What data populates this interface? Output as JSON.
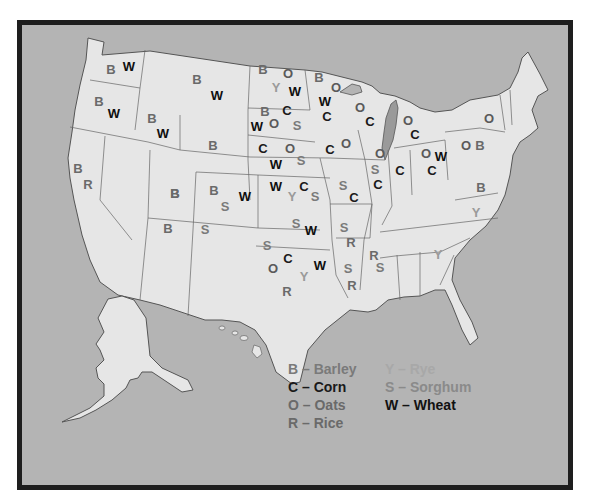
{
  "colors": {
    "ocean": "#b4b4b4",
    "land": "#e6e6e6",
    "border": "#1e1e1e",
    "state_line": "#555555",
    "lake": "#9a9a9a",
    "barley": "#6a6a6a",
    "corn": "#1a1a1a",
    "oats": "#5a5a5a",
    "rice": "#6a6a6a",
    "rye": "#9a9a9a",
    "sorghum": "#7a7a7a",
    "wheat": "#0f0f0f"
  },
  "legend": {
    "items": [
      {
        "code": "B",
        "dash": "–",
        "name": "Barley",
        "color": "#7a7a7a"
      },
      {
        "code": "C",
        "dash": "–",
        "name": "Corn",
        "color": "#1a1a1a"
      },
      {
        "code": "O",
        "dash": "–",
        "name": "Oats",
        "color": "#6a6a6a"
      },
      {
        "code": "R",
        "dash": "–",
        "name": "Rice",
        "color": "#6a6a6a"
      },
      {
        "code": "Y",
        "dash": "–",
        "name": "Rye",
        "color": "#a8a8a8"
      },
      {
        "code": "S",
        "dash": "–",
        "name": "Sorghum",
        "color": "#8a8a8a"
      },
      {
        "code": "W",
        "dash": "–",
        "name": "Wheat",
        "color": "#111111"
      }
    ]
  },
  "labels": [
    {
      "state": "Washington",
      "letter": "B",
      "x": 111,
      "y": 69
    },
    {
      "state": "Washington",
      "letter": "W",
      "x": 129,
      "y": 66
    },
    {
      "state": "Oregon",
      "letter": "B",
      "x": 99,
      "y": 101
    },
    {
      "state": "Oregon",
      "letter": "W",
      "x": 114,
      "y": 113
    },
    {
      "state": "Idaho",
      "letter": "B",
      "x": 152,
      "y": 118
    },
    {
      "state": "Idaho",
      "letter": "W",
      "x": 163,
      "y": 133
    },
    {
      "state": "Montana",
      "letter": "B",
      "x": 197,
      "y": 79
    },
    {
      "state": "Montana",
      "letter": "W",
      "x": 217,
      "y": 95
    },
    {
      "state": "California",
      "letter": "B",
      "x": 78,
      "y": 168
    },
    {
      "state": "California",
      "letter": "R",
      "x": 88,
      "y": 184
    },
    {
      "state": "Nevada",
      "letter": "B",
      "x": 175,
      "y": 193
    },
    {
      "state": "Wyoming",
      "letter": "B",
      "x": 213,
      "y": 145
    },
    {
      "state": "Utah",
      "letter": "B",
      "x": 175,
      "y": 193
    },
    {
      "state": "Colorado",
      "letter": "B",
      "x": 214,
      "y": 190
    },
    {
      "state": "Colorado",
      "letter": "S",
      "x": 225,
      "y": 206
    },
    {
      "state": "Colorado",
      "letter": "W",
      "x": 245,
      "y": 196
    },
    {
      "state": "Arizona",
      "letter": "B",
      "x": 168,
      "y": 228
    },
    {
      "state": "New Mexico",
      "letter": "S",
      "x": 205,
      "y": 229
    },
    {
      "state": "North Dakota",
      "letter": "B",
      "x": 263,
      "y": 69
    },
    {
      "state": "North Dakota",
      "letter": "O",
      "x": 288,
      "y": 73
    },
    {
      "state": "North Dakota",
      "letter": "Y",
      "x": 276,
      "y": 87
    },
    {
      "state": "North Dakota",
      "letter": "W",
      "x": 295,
      "y": 91
    },
    {
      "state": "South Dakota",
      "letter": "B",
      "x": 265,
      "y": 111
    },
    {
      "state": "South Dakota",
      "letter": "C",
      "x": 287,
      "y": 110
    },
    {
      "state": "South Dakota",
      "letter": "W",
      "x": 257,
      "y": 126
    },
    {
      "state": "South Dakota",
      "letter": "O",
      "x": 274,
      "y": 123
    },
    {
      "state": "South Dakota",
      "letter": "S",
      "x": 297,
      "y": 125
    },
    {
      "state": "Nebraska",
      "letter": "C",
      "x": 263,
      "y": 148
    },
    {
      "state": "Nebraska",
      "letter": "O",
      "x": 290,
      "y": 148
    },
    {
      "state": "Nebraska",
      "letter": "S",
      "x": 301,
      "y": 160
    },
    {
      "state": "Nebraska",
      "letter": "W",
      "x": 276,
      "y": 164
    },
    {
      "state": "Kansas",
      "letter": "W",
      "x": 276,
      "y": 186
    },
    {
      "state": "Kansas",
      "letter": "C",
      "x": 304,
      "y": 186
    },
    {
      "state": "Kansas",
      "letter": "Y",
      "x": 292,
      "y": 196
    },
    {
      "state": "Kansas",
      "letter": "S",
      "x": 315,
      "y": 196
    },
    {
      "state": "Oklahoma",
      "letter": "S",
      "x": 296,
      "y": 223
    },
    {
      "state": "Oklahoma",
      "letter": "W",
      "x": 311,
      "y": 230
    },
    {
      "state": "Texas",
      "letter": "S",
      "x": 267,
      "y": 245
    },
    {
      "state": "Texas",
      "letter": "C",
      "x": 288,
      "y": 258
    },
    {
      "state": "Texas",
      "letter": "O",
      "x": 273,
      "y": 268
    },
    {
      "state": "Texas",
      "letter": "W",
      "x": 320,
      "y": 265
    },
    {
      "state": "Texas",
      "letter": "Y",
      "x": 304,
      "y": 276
    },
    {
      "state": "Texas",
      "letter": "R",
      "x": 287,
      "y": 291
    },
    {
      "state": "Minnesota",
      "letter": "B",
      "x": 319,
      "y": 77
    },
    {
      "state": "Minnesota",
      "letter": "O",
      "x": 336,
      "y": 87
    },
    {
      "state": "Minnesota",
      "letter": "W",
      "x": 325,
      "y": 101
    },
    {
      "state": "Minnesota",
      "letter": "C",
      "x": 327,
      "y": 116
    },
    {
      "state": "Iowa",
      "letter": "C",
      "x": 330,
      "y": 149
    },
    {
      "state": "Iowa",
      "letter": "O",
      "x": 346,
      "y": 143
    },
    {
      "state": "Missouri",
      "letter": "S",
      "x": 343,
      "y": 185
    },
    {
      "state": "Missouri",
      "letter": "C",
      "x": 354,
      "y": 197
    },
    {
      "state": "Arkansas",
      "letter": "S",
      "x": 344,
      "y": 227
    },
    {
      "state": "Arkansas",
      "letter": "R",
      "x": 351,
      "y": 242
    },
    {
      "state": "Louisiana",
      "letter": "S",
      "x": 348,
      "y": 268
    },
    {
      "state": "Louisiana",
      "letter": "R",
      "x": 352,
      "y": 285
    },
    {
      "state": "Mississippi",
      "letter": "R",
      "x": 374,
      "y": 255
    },
    {
      "state": "Mississippi",
      "letter": "S",
      "x": 380,
      "y": 267
    },
    {
      "state": "Wisconsin",
      "letter": "O",
      "x": 360,
      "y": 107
    },
    {
      "state": "Wisconsin",
      "letter": "C",
      "x": 370,
      "y": 121
    },
    {
      "state": "Illinois",
      "letter": "O",
      "x": 380,
      "y": 153
    },
    {
      "state": "Illinois",
      "letter": "S",
      "x": 375,
      "y": 169
    },
    {
      "state": "Illinois",
      "letter": "C",
      "x": 378,
      "y": 184
    },
    {
      "state": "Indiana",
      "letter": "C",
      "x": 400,
      "y": 170
    },
    {
      "state": "Michigan",
      "letter": "O",
      "x": 408,
      "y": 120
    },
    {
      "state": "Michigan",
      "letter": "C",
      "x": 415,
      "y": 134
    },
    {
      "state": "Ohio",
      "letter": "O",
      "x": 426,
      "y": 153
    },
    {
      "state": "Ohio",
      "letter": "W",
      "x": 441,
      "y": 156
    },
    {
      "state": "Ohio",
      "letter": "C",
      "x": 432,
      "y": 170
    },
    {
      "state": "Pennsylvania",
      "letter": "O",
      "x": 466,
      "y": 145
    },
    {
      "state": "Pennsylvania",
      "letter": "B",
      "x": 480,
      "y": 145
    },
    {
      "state": "New York",
      "letter": "O",
      "x": 489,
      "y": 118
    },
    {
      "state": "Virginia",
      "letter": "B",
      "x": 481,
      "y": 187
    },
    {
      "state": "North Carolina",
      "letter": "Y",
      "x": 476,
      "y": 212
    },
    {
      "state": "Georgia",
      "letter": "Y",
      "x": 438,
      "y": 254
    }
  ]
}
